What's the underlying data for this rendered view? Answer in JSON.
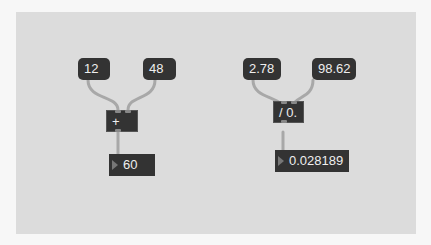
{
  "patch": {
    "left_group": {
      "message_a": "12",
      "message_b": "48",
      "operator": "+",
      "result": "60"
    },
    "right_group": {
      "message_a": "2.78",
      "message_b": "98.62",
      "operator": "/ 0.",
      "result": "0.028189"
    }
  },
  "colors": {
    "canvas": "#dcdcdc",
    "box": "#333333",
    "wire": "#a8a8a8"
  }
}
